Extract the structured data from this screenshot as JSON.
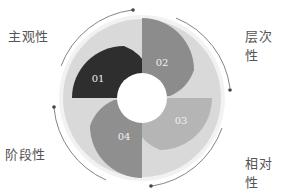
{
  "diagram": {
    "type": "cyclic-four-segment-ring",
    "center": {
      "x": 142,
      "y": 98
    },
    "colors": {
      "outer_ring": "#d9d9d9",
      "outer_ring_edge": "#eeeeee",
      "segment_01": "#2e2e2e",
      "segment_02": "#8c8c8c",
      "segment_03": "#b5b5b5",
      "segment_04": "#8f8f8f",
      "arrow": "#666666",
      "hole": "#ffffff"
    },
    "segments": [
      {
        "number": "01",
        "label": "主观性"
      },
      {
        "number": "02",
        "label": "层次性"
      },
      {
        "number": "03",
        "label": "相对性"
      },
      {
        "number": "04",
        "label": "阶段性"
      }
    ]
  }
}
